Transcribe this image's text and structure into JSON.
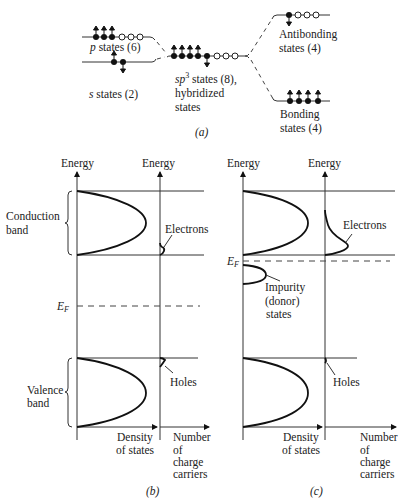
{
  "figure": {
    "panel_a": {
      "caption": "(a)",
      "p_states": {
        "label_sym": "p",
        "label_rest": " states (6)",
        "filled": 3,
        "empty": 3,
        "spin_up": 3
      },
      "s_states": {
        "label_sym": "s",
        "label_rest": " states (2)",
        "filled": 2,
        "spin_up": 1,
        "spin_down": 1
      },
      "sp3_states": {
        "label_line1_sym": "sp",
        "label_line1_sup": "3",
        "label_line1_rest": " states (8),",
        "label_line2": "hybridized",
        "label_line3": "states",
        "filled": 5,
        "empty": 3,
        "spin_up": 4,
        "spin_down": 1
      },
      "antibonding": {
        "label_line1": "Antibonding",
        "label_line2": "states (4)",
        "filled": 1,
        "empty": 3,
        "spin_down": 1
      },
      "bonding": {
        "label_line1": "Bonding",
        "label_line2": "states (4)",
        "filled": 4,
        "spin_up": 4
      }
    },
    "panel_b": {
      "caption": "(b)",
      "axis_energy_left": "Energy",
      "axis_energy_right": "Energy",
      "conduction_band": [
        "Conduction",
        "band"
      ],
      "valence_band": [
        "Valence",
        "band"
      ],
      "fermi_label": "E",
      "fermi_sub": "F",
      "electrons_label": "Electrons",
      "holes_label": "Holes",
      "x_axis_dos": [
        "Density",
        "of states"
      ],
      "x_axis_carriers": [
        "Number",
        "of",
        "charge",
        "carriers"
      ]
    },
    "panel_c": {
      "caption": "(c)",
      "axis_energy_left": "Energy",
      "axis_energy_right": "Energy",
      "fermi_label": "E",
      "fermi_sub": "F",
      "electrons_label": "Electrons",
      "holes_label": "Holes",
      "impurity_label": [
        "Impurity",
        "(donor)",
        "states"
      ],
      "x_axis_dos": [
        "Density",
        "of states"
      ],
      "x_axis_carriers": [
        "Number",
        "of",
        "charge",
        "carriers"
      ]
    }
  }
}
